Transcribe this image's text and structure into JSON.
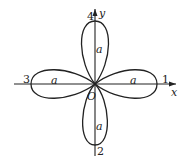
{
  "diagram": {
    "type": "four-leaf rose curve (polar)",
    "axes": {
      "x_label": "x",
      "y_label": "y",
      "origin_label": "O"
    },
    "petals": [
      {
        "direction": "right",
        "number": "1",
        "length_label": "a"
      },
      {
        "direction": "down",
        "number": "2",
        "length_label": "a"
      },
      {
        "direction": "left",
        "number": "3",
        "length_label": "a"
      },
      {
        "direction": "up",
        "number": "4",
        "length_label": "a"
      }
    ]
  }
}
